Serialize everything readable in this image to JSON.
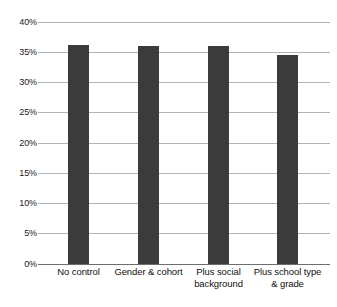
{
  "chart_data": {
    "type": "bar",
    "title": "",
    "subtitle": "",
    "xlabel": "",
    "ylabel": "",
    "categories": [
      "No control",
      "Gender & cohort",
      "Plus social background",
      "Plus school type & grade"
    ],
    "values": [
      36.1,
      36.0,
      35.9,
      34.4
    ],
    "value_labels": [
      "",
      "",
      "",
      ""
    ],
    "ylim": [
      0,
      40
    ],
    "ytick_values": [
      0,
      5,
      10,
      15,
      20,
      25,
      30,
      35,
      40
    ],
    "ytick_labels": [
      "0%",
      "5%",
      "10%",
      "15%",
      "20%",
      "25%",
      "30%",
      "35%",
      "40%"
    ],
    "grid": true,
    "legend": null,
    "legend_position": "none",
    "bar_color": "#3b3b3b",
    "gridline_color": "#b4b4b4",
    "axis_color": "#6e6e6e",
    "background_color": "#ffffff"
  }
}
